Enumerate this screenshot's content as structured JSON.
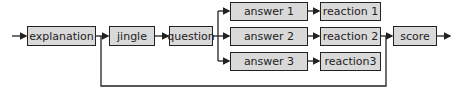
{
  "diagram": {
    "type": "flowchart",
    "nodes": {
      "explanation": "explanation",
      "jingle": "jingle",
      "question": "question",
      "answer1": "answer 1",
      "answer2": "answer 2",
      "answer3": "answer 3",
      "reaction1": "reaction 1",
      "reaction2": "reaction 2",
      "reaction3": "reaction3",
      "score": "score"
    },
    "edges": [
      [
        "start",
        "explanation"
      ],
      [
        "explanation",
        "jingle"
      ],
      [
        "jingle",
        "question"
      ],
      [
        "question",
        "answer 1"
      ],
      [
        "question",
        "answer 2"
      ],
      [
        "question",
        "answer 3"
      ],
      [
        "answer 1",
        "reaction 1"
      ],
      [
        "answer 2",
        "reaction 2"
      ],
      [
        "answer 3",
        "reaction3"
      ],
      [
        "reaction 2",
        "score"
      ],
      [
        "explanation",
        "score"
      ],
      [
        "score",
        "end"
      ]
    ],
    "colors": {
      "box_fill": "#d9d9d9",
      "stroke": "#222222"
    }
  }
}
